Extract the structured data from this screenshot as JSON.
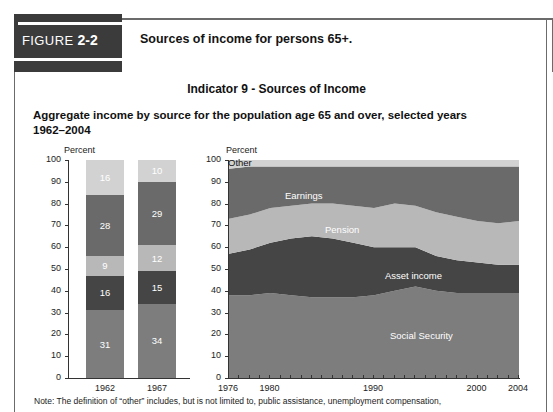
{
  "figure": {
    "badge_label": "FIGURE",
    "badge_number": "2-2",
    "caption": "Sources of income for persons 65+."
  },
  "titles": {
    "indicator": "Indicator 9 - Sources of Income",
    "subtitle": "Aggregate income by source for the population age 65 and over, selected years 1962–2004"
  },
  "note": "Note: The definition of “other” includes, but is not limited to, public assistance, unemployment compensation,",
  "colors": {
    "social_security": "#7d7d7d",
    "asset_income": "#454545",
    "pension": "#b8b8b8",
    "earnings": "#6a6a6a",
    "other": "#d2d2d2",
    "badge": "#3b3b3b"
  },
  "chart_data": [
    {
      "type": "bar",
      "id": "stacked-bar",
      "title": "",
      "ylabel": "Percent",
      "xlabel": "",
      "ylim": [
        0,
        100
      ],
      "yticks": [
        0,
        10,
        20,
        30,
        40,
        50,
        60,
        70,
        80,
        90,
        100
      ],
      "categories": [
        "1962",
        "1967"
      ],
      "stacked": true,
      "grid": false,
      "series": [
        {
          "name": "Social Security",
          "values": [
            31,
            34
          ],
          "color": "#7d7d7d"
        },
        {
          "name": "Asset income",
          "values": [
            16,
            15
          ],
          "color": "#454545"
        },
        {
          "name": "Pension",
          "values": [
            9,
            12
          ],
          "color": "#b8b8b8"
        },
        {
          "name": "Earnings",
          "values": [
            28,
            29
          ],
          "color": "#6a6a6a"
        },
        {
          "name": "Other",
          "values": [
            16,
            10
          ],
          "color": "#d2d2d2"
        }
      ]
    },
    {
      "type": "area",
      "id": "stacked-area",
      "title": "",
      "ylabel": "Percent",
      "xlabel": "",
      "ylim": [
        0,
        100
      ],
      "yticks": [
        0,
        10,
        20,
        30,
        40,
        50,
        60,
        70,
        80,
        90,
        100
      ],
      "xlim": [
        1976,
        2004
      ],
      "xticks": [
        1976,
        1980,
        1990,
        2000,
        2004
      ],
      "x": [
        1976,
        1978,
        1980,
        1982,
        1984,
        1986,
        1988,
        1990,
        1992,
        1994,
        1996,
        1998,
        2000,
        2002,
        2004
      ],
      "stacked": true,
      "grid": false,
      "legend_position": "inline-band-labels",
      "series": [
        {
          "name": "Social Security",
          "color": "#7d7d7d",
          "values": [
            38,
            38,
            39,
            38,
            37,
            37,
            37,
            38,
            40,
            42,
            40,
            39,
            39,
            39,
            39
          ]
        },
        {
          "name": "Asset income",
          "color": "#454545",
          "values": [
            19,
            21,
            23,
            26,
            28,
            27,
            25,
            22,
            20,
            18,
            16,
            15,
            14,
            13,
            13
          ]
        },
        {
          "name": "Pension",
          "color": "#b8b8b8",
          "values": [
            16,
            16,
            16,
            15,
            15,
            16,
            17,
            18,
            20,
            19,
            20,
            20,
            19,
            19,
            20
          ]
        },
        {
          "name": "Earnings",
          "color": "#6a6a6a",
          "values": [
            23,
            22,
            19,
            18,
            17,
            17,
            18,
            19,
            17,
            18,
            21,
            23,
            25,
            26,
            25
          ]
        },
        {
          "name": "Other",
          "color": "#d2d2d2",
          "values": [
            4,
            3,
            3,
            3,
            3,
            3,
            3,
            3,
            3,
            3,
            3,
            3,
            3,
            3,
            3
          ]
        }
      ],
      "band_labels": [
        {
          "text": "Other",
          "style": "dark"
        },
        {
          "text": "Earnings",
          "style": "light"
        },
        {
          "text": "Pension",
          "style": "light"
        },
        {
          "text": "Asset income",
          "style": "light"
        },
        {
          "text": "Social Security",
          "style": "light"
        }
      ]
    }
  ]
}
